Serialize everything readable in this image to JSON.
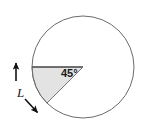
{
  "figure": {
    "background_color": "#ffffff",
    "width": 144,
    "height": 128
  },
  "circle": {
    "name": "circle-outline",
    "center_x": 83,
    "center_y": 67,
    "radius": 51,
    "stroke_color": "#6b6b6b",
    "stroke_width": 1,
    "fill_color": "none"
  },
  "sector": {
    "name": "shaded-sector",
    "fill_color": "#e3e3e3",
    "stroke_color": "#8a8a8a",
    "start_angle_deg": 180,
    "end_angle_deg": 225,
    "sweep_deg": 45,
    "vertex_x": 83,
    "vertex_y": 67,
    "arc_start_x": 32,
    "arc_start_y": 67,
    "arc_end_x": 47,
    "arc_end_y": 103
  },
  "labels": {
    "angle": {
      "text": "45°",
      "x": 61,
      "y": 77,
      "color": "#1a1a1a"
    },
    "length": {
      "text": "L",
      "x": 17,
      "y": 97,
      "color": "#1a1a1a"
    }
  },
  "arrows": {
    "upper": {
      "name": "arrow-up",
      "x1": 16,
      "y1": 81,
      "x2": 16,
      "y2": 62,
      "color": "#111111"
    },
    "lower": {
      "name": "arrow-down-right",
      "x1": 25,
      "y1": 99,
      "x2": 39,
      "y2": 114,
      "color": "#111111"
    }
  }
}
